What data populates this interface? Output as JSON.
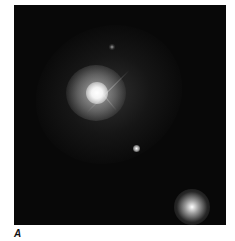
{
  "figure": {
    "panel_label": "A",
    "background_color": "#080808",
    "objects": [
      {
        "name": "main-galaxy-core",
        "cx": 96,
        "cy": 92
      },
      {
        "name": "small-star",
        "cx": 136,
        "cy": 148
      },
      {
        "name": "faint-star",
        "cx": 112,
        "cy": 47
      },
      {
        "name": "compact-galaxy",
        "cx": 192,
        "cy": 208
      }
    ]
  }
}
